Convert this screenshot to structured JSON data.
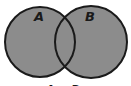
{
  "diagram": {
    "type": "venn",
    "sets": [
      {
        "label": "A",
        "cx": 40,
        "cy": 42,
        "r": 35
      },
      {
        "label": "B",
        "cx": 91,
        "cy": 42,
        "r": 36
      }
    ],
    "caption": "A ∪ B",
    "colors": {
      "fill": "#8c8c8c",
      "stroke": "#1a1a1a",
      "background": "#ffffff"
    }
  }
}
